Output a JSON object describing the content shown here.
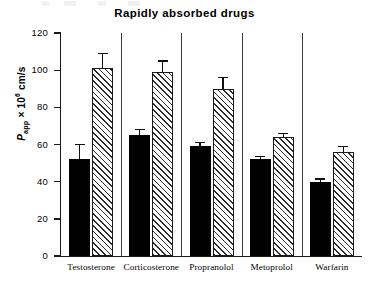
{
  "chart_data": {
    "type": "bar",
    "title": "Rapidly absorbed drugs",
    "xlabel": "",
    "ylabel": "Papp × 10⁶ cm/s",
    "ylabel_parts": {
      "symbol": "P",
      "subscript": "app",
      "times": "× 10",
      "exponent": "6",
      "units": "cm/s"
    },
    "ylim": [
      0,
      120
    ],
    "yticks": [
      0,
      20,
      40,
      60,
      80,
      100,
      120
    ],
    "ytick_labels": [
      "0",
      "20",
      "40",
      "60",
      "80",
      "100",
      "120"
    ],
    "grid": false,
    "legend": null,
    "categories": [
      "Testosterone",
      "Corticosterone",
      "Propranolol",
      "Metoprolol",
      "Warfarin"
    ],
    "series": [
      {
        "name": "solid",
        "style": "filled-black",
        "values": [
          52,
          65,
          59,
          52,
          40
        ],
        "errors": [
          8,
          3,
          2,
          1.5,
          1.5
        ]
      },
      {
        "name": "hatched",
        "style": "diagonal-hatch",
        "values": [
          101,
          99,
          90,
          64,
          56
        ],
        "errors": [
          8,
          6,
          6,
          2,
          3
        ]
      }
    ]
  },
  "axis": {
    "tick_labels": [
      "120",
      "100",
      "80",
      "60",
      "40",
      "20",
      "0"
    ]
  }
}
